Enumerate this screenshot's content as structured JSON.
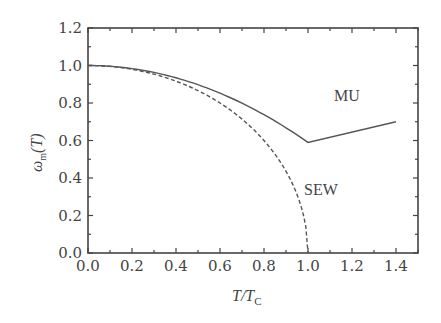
{
  "chart_data": {
    "type": "line",
    "title": "",
    "xlabel": "T/T_C",
    "ylabel": "ω_m(T)",
    "xlim": [
      0.0,
      1.5
    ],
    "ylim": [
      0.0,
      1.2
    ],
    "xticks": [
      "0.0",
      "0.2",
      "0.4",
      "0.6",
      "0.8",
      "1.0",
      "1.2",
      "1.4"
    ],
    "yticks": [
      "0.0",
      "0.2",
      "0.4",
      "0.6",
      "0.8",
      "1.0",
      "1.2"
    ],
    "grid": false,
    "legend": "none (inline annotations)",
    "series": [
      {
        "name": "MU",
        "style": "solid",
        "x": [
          0.0,
          0.1,
          0.2,
          0.3,
          0.4,
          0.5,
          0.6,
          0.7,
          0.8,
          0.9,
          1.0,
          1.1,
          1.2,
          1.3,
          1.4
        ],
        "y": [
          1.0,
          0.996,
          0.984,
          0.963,
          0.934,
          0.898,
          0.852,
          0.799,
          0.738,
          0.668,
          0.59,
          0.618,
          0.645,
          0.673,
          0.7
        ]
      },
      {
        "name": "SEW",
        "style": "dashed",
        "x": [
          0.0,
          0.1,
          0.2,
          0.3,
          0.4,
          0.5,
          0.6,
          0.7,
          0.8,
          0.85,
          0.9,
          0.95,
          0.98,
          1.0
        ],
        "y": [
          1.0,
          0.995,
          0.98,
          0.954,
          0.917,
          0.866,
          0.8,
          0.714,
          0.6,
          0.527,
          0.436,
          0.312,
          0.199,
          0.0
        ]
      }
    ],
    "annotations": [
      {
        "text": "MU",
        "x": 1.12,
        "y": 0.84
      },
      {
        "text": "SEW",
        "x": 1.0,
        "y": 0.32
      }
    ]
  },
  "labels": {
    "xlabel": "T/T",
    "xlabel_sub": "C",
    "ylabel_main": "ω",
    "ylabel_sub": "m",
    "ylabel_arg": "(T)",
    "mu": "MU",
    "sew": "SEW"
  }
}
